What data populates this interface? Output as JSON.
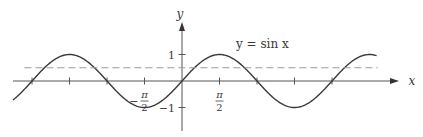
{
  "chart_data": {
    "type": "line",
    "title": "",
    "function_label": "y = sin x",
    "xlabel": "x",
    "ylabel": "y",
    "xlim": [
      -7.1,
      8.5
    ],
    "ylim": [
      -1.4,
      2.0
    ],
    "x_ticks_pi_multiples": [
      -2,
      -1.5,
      -1,
      -0.5,
      0.5,
      1,
      1.5,
      2
    ],
    "x_tick_labels": [
      {
        "value_pi": -0.5,
        "sign": "−",
        "numerator": "π",
        "denominator": "2"
      },
      {
        "value_pi": 0.5,
        "sign": "",
        "numerator": "π",
        "denominator": "2"
      }
    ],
    "y_ticks": [
      1,
      -1
    ],
    "y_tick_labels": [
      "1",
      "−1"
    ],
    "series": [
      {
        "name": "y = sin x",
        "function": "sin",
        "x_range": [
          -7.08,
          8.15
        ],
        "style": "solid"
      },
      {
        "name": "y = 1/2",
        "function": "constant",
        "value": 0.5,
        "x_range": [
          -6.6,
          8.2
        ],
        "style": "dashed"
      }
    ],
    "grid": false,
    "legend": "none"
  },
  "colors": {
    "curve": "#3a3a3a",
    "axis": "#555555",
    "dashed": "#9a9a9a"
  }
}
